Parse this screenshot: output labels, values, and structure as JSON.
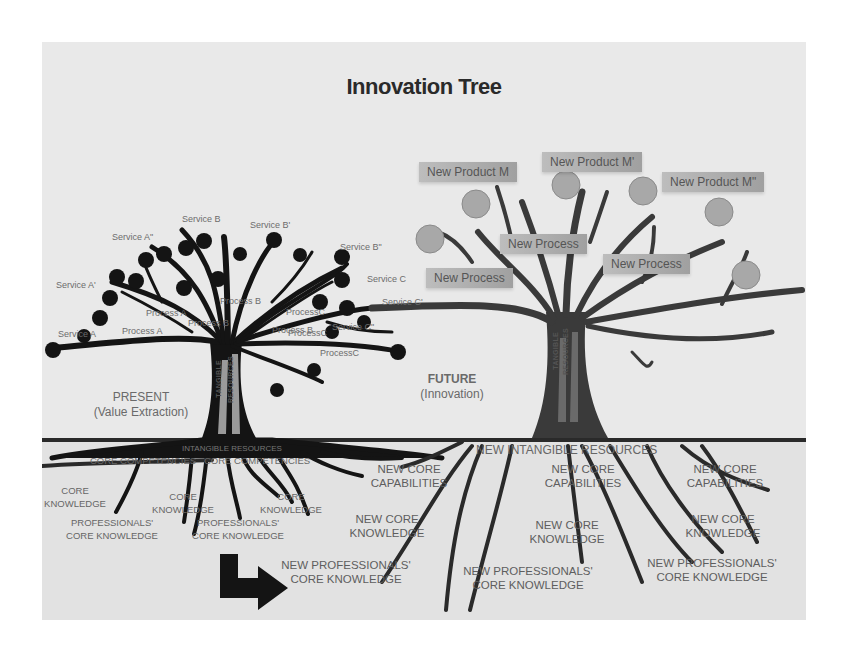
{
  "title": "Innovation Tree",
  "present": {
    "heading": "PRESENT",
    "subheading": "(Value Extraction)",
    "trunk_labels": [
      "TANGIBLE",
      "RESOURCES"
    ],
    "branch_labels": {
      "services": [
        "Service A",
        "Service A'",
        "Service A\"",
        "Service B",
        "Service B'",
        "Service B\"",
        "Service C",
        "Service C'",
        "Service C\""
      ],
      "processes": [
        "Process A",
        "Process A",
        "Process B",
        "Process B",
        "Process B",
        "ProcessC",
        "ProcessC",
        "ProcessC"
      ]
    },
    "underground": {
      "header": "INTANGIBLE RESOURCES",
      "labels": [
        "CORE COMPETENCIES",
        "CORE COMPETENCIES",
        "CORE KNOWLEDGE",
        "CORE KNOWLEDGE",
        "CORE KNOWLEDGE",
        "PROFESSIONALS' CORE KNOWLEDGE",
        "PROFESSIONALS' CORE KNOWLEDGE"
      ]
    }
  },
  "future": {
    "heading": "FUTURE",
    "subheading": "(Innovation)",
    "trunk_labels": [
      "TANGIBLE",
      "RESOURCES"
    ],
    "products": [
      "New Product M",
      "New Product M'",
      "New Product M\""
    ],
    "processes": [
      "New Process",
      "New Process",
      "New Process"
    ],
    "underground": {
      "header": "NEW INTANGIBLE RESOURCES",
      "labels": [
        "NEW CORE CAPABILITIES",
        "NEW CORE CAPABILITIES",
        "NEW CORE CAPABILITIES",
        "NEW CORE KNOWLEDGE",
        "NEW CORE KNOWLEDGE",
        "NEW CORE KNOWLEDGE",
        "NEW PROFESSIONALS' CORE KNOWLEDGE",
        "NEW PROFESSIONALS' CORE KNOWLEDGE",
        "NEW PROFESSIONALS' CORE KNOWLEDGE"
      ]
    }
  },
  "colors": {
    "background": "#e9e9e9",
    "present_tree": "#141414",
    "future_tree": "#3a3a3a",
    "future_fruit": "#a8a8a8",
    "label_text": "#6c6c6c"
  }
}
